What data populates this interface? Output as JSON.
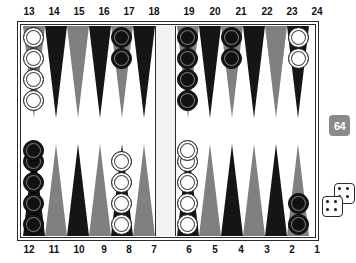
{
  "board": {
    "title": "Backgammon Board",
    "top_labels": [
      "13",
      "14",
      "15",
      "16",
      "17",
      "18",
      "19",
      "20",
      "21",
      "22",
      "23",
      "24"
    ],
    "bottom_labels": [
      "12",
      "11",
      "10",
      "9",
      "8",
      "7",
      "6",
      "5",
      "4",
      "3",
      "2",
      "1"
    ],
    "colors": {
      "point_dark": "#151515",
      "point_gray": "#808080",
      "board_background": "#ffffff",
      "frame": "#2a2a2a",
      "bar": "#f2f2f2",
      "checker_white": "#fdfdfd",
      "checker_black": "#111111",
      "cube_background": "#8a8a8a",
      "cube_text": "#ffffff",
      "die_face": "#ffffff",
      "die_pip": "#111111"
    },
    "points": [
      {
        "number": "13",
        "quadrant": "top-left",
        "triangle": "gray",
        "checkers": 4,
        "color": "white"
      },
      {
        "number": "14",
        "quadrant": "top-left",
        "triangle": "dark",
        "checkers": 0,
        "color": null
      },
      {
        "number": "15",
        "quadrant": "top-left",
        "triangle": "gray",
        "checkers": 0,
        "color": null
      },
      {
        "number": "16",
        "quadrant": "top-left",
        "triangle": "dark",
        "checkers": 0,
        "color": null
      },
      {
        "number": "17",
        "quadrant": "top-left",
        "triangle": "gray",
        "checkers": 2,
        "color": "black"
      },
      {
        "number": "18",
        "quadrant": "top-left",
        "triangle": "dark",
        "checkers": 0,
        "color": null
      },
      {
        "number": "19",
        "quadrant": "top-right",
        "triangle": "gray",
        "checkers": 4,
        "color": "black"
      },
      {
        "number": "20",
        "quadrant": "top-right",
        "triangle": "dark",
        "checkers": 0,
        "color": null
      },
      {
        "number": "21",
        "quadrant": "top-right",
        "triangle": "gray",
        "checkers": 2,
        "color": "black"
      },
      {
        "number": "22",
        "quadrant": "top-right",
        "triangle": "dark",
        "checkers": 0,
        "color": null
      },
      {
        "number": "23",
        "quadrant": "top-right",
        "triangle": "gray",
        "checkers": 0,
        "color": null
      },
      {
        "number": "24",
        "quadrant": "top-right",
        "triangle": "dark",
        "checkers": 2,
        "color": "white"
      },
      {
        "number": "12",
        "quadrant": "bottom-left",
        "triangle": "dark",
        "checkers": 5,
        "color": "black"
      },
      {
        "number": "11",
        "quadrant": "bottom-left",
        "triangle": "gray",
        "checkers": 0,
        "color": null
      },
      {
        "number": "10",
        "quadrant": "bottom-left",
        "triangle": "dark",
        "checkers": 0,
        "color": null
      },
      {
        "number": "9",
        "quadrant": "bottom-left",
        "triangle": "gray",
        "checkers": 0,
        "color": null
      },
      {
        "number": "8",
        "quadrant": "bottom-left",
        "triangle": "dark",
        "checkers": 4,
        "color": "white"
      },
      {
        "number": "7",
        "quadrant": "bottom-left",
        "triangle": "gray",
        "checkers": 0,
        "color": null
      },
      {
        "number": "6",
        "quadrant": "bottom-right",
        "triangle": "dark",
        "checkers": 5,
        "color": "white"
      },
      {
        "number": "5",
        "quadrant": "bottom-right",
        "triangle": "gray",
        "checkers": 0,
        "color": null
      },
      {
        "number": "4",
        "quadrant": "bottom-right",
        "triangle": "dark",
        "checkers": 0,
        "color": null
      },
      {
        "number": "3",
        "quadrant": "bottom-right",
        "triangle": "gray",
        "checkers": 0,
        "color": null
      },
      {
        "number": "2",
        "quadrant": "bottom-right",
        "triangle": "dark",
        "checkers": 0,
        "color": null
      },
      {
        "number": "1",
        "quadrant": "bottom-right",
        "triangle": "gray",
        "checkers": 2,
        "color": "black"
      }
    ],
    "bar_checkers": {
      "white": 0,
      "black": 0
    }
  },
  "doubling_cube": {
    "value": "64",
    "label": "doubling cube showing 64"
  },
  "dice": [
    {
      "name": "die-upper",
      "value": 4,
      "pips": 4
    },
    {
      "name": "die-lower",
      "value": 4,
      "pips": 4
    }
  ]
}
